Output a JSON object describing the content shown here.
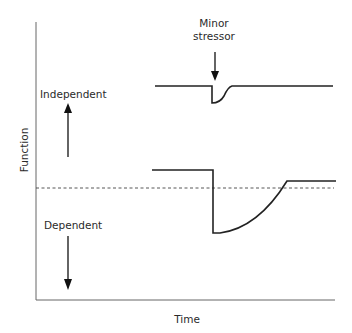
{
  "diagram": {
    "axes": {
      "y_label": "Function",
      "x_label": "Time"
    },
    "annotations": {
      "stressor_line1": "Minor",
      "stressor_line2": "stressor",
      "upper_direction": "Independent",
      "lower_direction": "Dependent"
    },
    "curves": [
      {
        "name": "independent",
        "description": "High baseline; small brief dip at stressor, quick recovery to baseline",
        "baseline_y": 86,
        "dip_bottom_y": 103
      },
      {
        "name": "dependent",
        "description": "Lower baseline; large dip at stressor below threshold, slow recovery to a level slightly above threshold",
        "baseline_y": 170,
        "dip_bottom_y": 233,
        "recovered_y": 181
      }
    ],
    "threshold": {
      "style": "dashed",
      "y": 188
    },
    "colors": {
      "line": "#222222",
      "axis": "#555555",
      "dashed": "#444444"
    }
  }
}
